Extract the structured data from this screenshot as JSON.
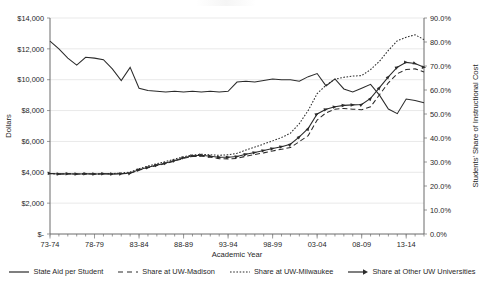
{
  "chart_data": {
    "type": "line",
    "title": "",
    "xlabel": "Academic Year",
    "ylabel": "Dollars",
    "y2label": "Students' Share of Instructional Cost",
    "grid": true,
    "legend_position": "bottom",
    "ylim": [
      0,
      14000
    ],
    "y2lim": [
      0,
      0.9
    ],
    "y_ticks": [
      "$-",
      "$2,000",
      "$4,000",
      "$6,000",
      "$8,000",
      "$10,000",
      "$12,000",
      "$14,000"
    ],
    "y_tick_values": [
      0,
      2000,
      4000,
      6000,
      8000,
      10000,
      12000,
      14000
    ],
    "y2_ticks": [
      "0.0%",
      "10.0%",
      "20.0%",
      "30.0%",
      "40.0%",
      "50.0%",
      "60.0%",
      "70.0%",
      "80.0%",
      "90.0%"
    ],
    "y2_tick_values": [
      0,
      10,
      20,
      30,
      40,
      50,
      60,
      70,
      80,
      90
    ],
    "x_ticks": [
      "73-74",
      "78-79",
      "83-84",
      "88-89",
      "93-94",
      "98-99",
      "03-04",
      "08-09",
      "13-14"
    ],
    "x_tick_indices": [
      0,
      5,
      10,
      15,
      20,
      25,
      30,
      35,
      40
    ],
    "categories": [
      "73-74",
      "74-75",
      "75-76",
      "76-77",
      "77-78",
      "78-79",
      "79-80",
      "80-81",
      "81-82",
      "82-83",
      "83-84",
      "84-85",
      "85-86",
      "86-87",
      "87-88",
      "88-89",
      "89-90",
      "90-91",
      "91-92",
      "92-93",
      "93-94",
      "94-95",
      "95-96",
      "96-97",
      "97-98",
      "98-99",
      "99-00",
      "00-01",
      "01-02",
      "02-03",
      "03-04",
      "04-05",
      "05-06",
      "06-07",
      "07-08",
      "08-09",
      "09-10",
      "10-11",
      "11-12",
      "12-13",
      "13-14",
      "14-15",
      "15-16"
    ],
    "series": [
      {
        "name": "State Aid per Student",
        "axis": "left",
        "unit": "dollars",
        "style": "solid",
        "values": [
          12500,
          12000,
          11400,
          10950,
          11450,
          11400,
          11300,
          10700,
          9950,
          10800,
          9450,
          9300,
          9250,
          9200,
          9250,
          9200,
          9250,
          9200,
          9250,
          9200,
          9250,
          9850,
          9900,
          9850,
          9950,
          10050,
          10000,
          10000,
          9900,
          10200,
          10400,
          9600,
          10050,
          9400,
          9200,
          9450,
          9700,
          9000,
          8100,
          7800,
          8750,
          8650,
          8500
        ]
      },
      {
        "name": "Share at UW-Madison",
        "axis": "right",
        "unit": "percent",
        "style": "dashed",
        "values": [
          25.2,
          25.0,
          25.1,
          25.0,
          25.1,
          25.0,
          25.1,
          25.0,
          25.1,
          25.3,
          26.6,
          27.6,
          28.5,
          29.4,
          30.4,
          31.5,
          32.3,
          32.4,
          32.0,
          31.4,
          31.3,
          31.5,
          32.4,
          33.1,
          33.8,
          34.6,
          35.3,
          36.0,
          38.5,
          41.0,
          47.5,
          50.5,
          52.0,
          52.3,
          52.0,
          51.8,
          53.0,
          58.0,
          63.0,
          66.8,
          68.5,
          68.8,
          67.5
        ]
      },
      {
        "name": "Share at UW-Milwaukee",
        "axis": "right",
        "unit": "percent",
        "style": "dotted",
        "values": [
          25.2,
          25.0,
          25.1,
          25.0,
          25.1,
          25.0,
          25.1,
          25.2,
          25.4,
          25.8,
          27.2,
          28.3,
          29.3,
          30.2,
          31.2,
          32.2,
          32.9,
          33.2,
          33.0,
          32.8,
          33.0,
          33.6,
          35.0,
          36.2,
          37.5,
          38.8,
          40.2,
          42.0,
          46.0,
          51.5,
          58.5,
          62.0,
          64.5,
          65.3,
          65.8,
          66.0,
          68.5,
          72.0,
          76.5,
          80.5,
          82.0,
          83.0,
          81.0
        ]
      },
      {
        "name": "Share at Other UW Universities",
        "axis": "right",
        "unit": "percent",
        "style": "solid-markers",
        "values": [
          25.2,
          25.0,
          25.1,
          25.0,
          25.1,
          25.0,
          25.1,
          25.0,
          25.1,
          25.4,
          26.8,
          27.8,
          28.7,
          29.6,
          30.6,
          31.8,
          32.6,
          32.8,
          32.4,
          32.0,
          32.0,
          32.3,
          33.2,
          34.0,
          34.8,
          35.6,
          36.4,
          37.4,
          40.5,
          44.0,
          50.0,
          52.0,
          53.0,
          53.6,
          53.8,
          54.0,
          56.5,
          61.0,
          65.5,
          69.5,
          71.5,
          71.0,
          69.5
        ]
      }
    ]
  },
  "axes": {
    "left_title": "Dollars",
    "right_title": "Students' Share of Instructional Cost",
    "bottom_title": "Academic Year"
  },
  "legend": {
    "items": [
      {
        "label": "State Aid per Student",
        "swatch": "line-solid"
      },
      {
        "label": "Share at UW-Madison",
        "swatch": "line-dashed"
      },
      {
        "label": "Share at UW-Milwaukee",
        "swatch": "line-dotted"
      },
      {
        "label": "Share at Other UW Universities",
        "swatch": "line-arrow-markers"
      }
    ]
  },
  "colors": {
    "series": "#2b2b2b",
    "grid": "#e9e9e9",
    "axis": "#6b6b6b",
    "text": "#1f1f1f",
    "background": "#ffffff"
  }
}
